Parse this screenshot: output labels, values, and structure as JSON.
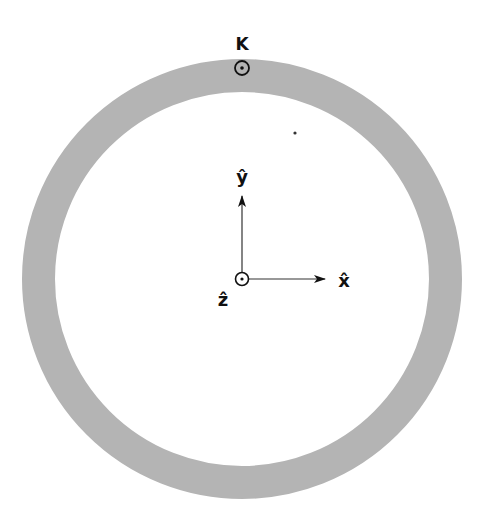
{
  "diagram": {
    "ring": {
      "cx": 242,
      "cy": 279,
      "outer_r": 220,
      "thickness": 33,
      "color": "#b4b4b4"
    },
    "current_label": "K",
    "current_symbol": "out-of-page (dot in circle)",
    "axes": {
      "x_label": "x̂",
      "y_label": "ŷ",
      "z_label": "ẑ"
    },
    "colors": {
      "ink": "#111111",
      "ring": "#b4b4b4",
      "background": "#ffffff"
    }
  }
}
